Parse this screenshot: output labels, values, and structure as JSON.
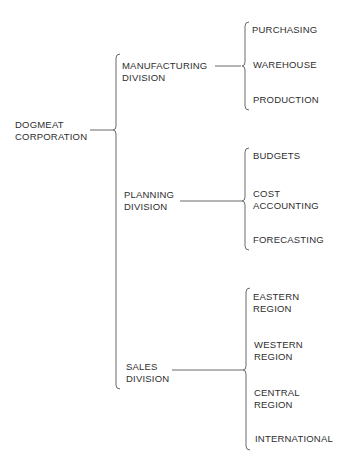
{
  "diagram": {
    "type": "organization-chart-brackets",
    "root": {
      "lines": [
        "DOGMEAT",
        "CORPORATION"
      ]
    },
    "divisions": [
      {
        "lines": [
          "MANUFACTURING",
          "DIVISION"
        ],
        "departments": [
          {
            "lines": [
              "PURCHASING"
            ]
          },
          {
            "lines": [
              "WAREHOUSE"
            ]
          },
          {
            "lines": [
              "PRODUCTION"
            ]
          }
        ]
      },
      {
        "lines": [
          "PLANNING",
          "DIVISION"
        ],
        "departments": [
          {
            "lines": [
              "BUDGETS"
            ]
          },
          {
            "lines": [
              "COST",
              "ACCOUNTING"
            ]
          },
          {
            "lines": [
              "FORECASTING"
            ]
          }
        ]
      },
      {
        "lines": [
          "SALES",
          "DIVISION"
        ],
        "departments": [
          {
            "lines": [
              "EASTERN",
              "REGION"
            ]
          },
          {
            "lines": [
              "WESTERN",
              "REGION"
            ]
          },
          {
            "lines": [
              "CENTRAL",
              "REGION"
            ]
          },
          {
            "lines": [
              "INTERNATIONAL"
            ]
          }
        ]
      }
    ],
    "colors": {
      "line": "#6a6a6a",
      "text": "#2e2e2e",
      "background": "#ffffff"
    }
  }
}
